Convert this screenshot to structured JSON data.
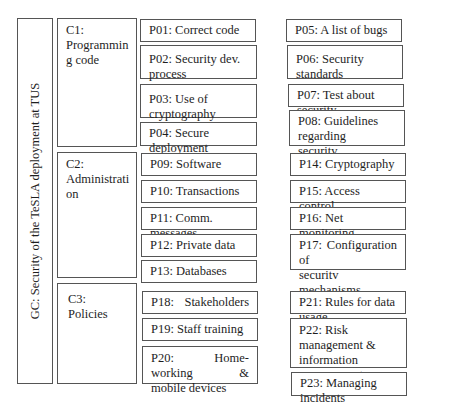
{
  "gc": {
    "label": "GC: Security of the TeSLA deployment at TUS"
  },
  "categories": [
    {
      "id": "C1",
      "label": "C1: Programmin g code",
      "line1": "C1:",
      "line2": "Programmin",
      "line3": "g code"
    },
    {
      "id": "C2",
      "label": "C2: Administrati on",
      "line1": "C2:",
      "line2": "Administrati",
      "line3": "on"
    },
    {
      "id": "C3",
      "label": "C3: Policies",
      "line1": "C3: Policies"
    }
  ],
  "practices": {
    "p01": "P01: Correct code",
    "p02": "P02: Security dev. process",
    "p03": "P03: Use of cryptography",
    "p04": "P04: Secure deployment",
    "p05": "P05: A list of bugs",
    "p06": "P06: Security standards",
    "p07": "P07: Test about security",
    "p08_1": "P08: Guidelines regarding",
    "p08_2": "securitv",
    "p09": "P09: Software",
    "p10": "P10: Transactions",
    "p11": "P11: Comm. messages",
    "p12": "P12: Private data",
    "p13": "P13: Databases",
    "p14": "P14: Cryptography",
    "p15": "P15: Access control",
    "p16": "P16: Net monitoring",
    "p17_1": "P17:   Configuration   of",
    "p17_2": "securitv mechanisms",
    "p18": "P18:            Stakeholders",
    "p19": "P19: Staff training",
    "p20_1": "P20:   Home-working   &",
    "p20_2": "mobile devices",
    "p21": "P21: Rules for data usage",
    "p22_1": "P22: Risk management &",
    "p22_2": "information management",
    "p23": "P23: Managing incidents"
  }
}
